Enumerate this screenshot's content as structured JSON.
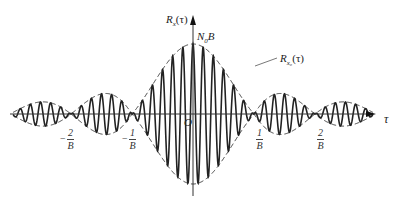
{
  "figure": {
    "y_axis_label": "R",
    "y_axis_label_sub": "x",
    "y_axis_label_arg": "(τ)",
    "peak_label": "N",
    "peak_label_sub": "0",
    "peak_label_tail": "B",
    "envelope_label": "R",
    "envelope_label_sub": "x₀",
    "envelope_label_arg": "(τ)",
    "x_axis_label": "τ",
    "origin_label": "O",
    "ticks": [
      {
        "sign": "−",
        "num": "2",
        "den": "B"
      },
      {
        "sign": "−",
        "num": "1",
        "den": "B"
      },
      {
        "sign": "",
        "num": "1",
        "den": "B"
      },
      {
        "sign": "",
        "num": "2",
        "den": "B"
      }
    ]
  },
  "chart_data": {
    "type": "line",
    "title": "",
    "xlabel": "τ",
    "ylabel": "R_x(τ)",
    "series": [
      {
        "name": "R_x(τ) = N0·B·sinc(Bτ)·cos(ω0·τ)",
        "style": "solid",
        "description": "bandpass noise autocorrelation, oscillating carrier under sinc envelope"
      },
      {
        "name": "R_x0(τ) envelope",
        "style": "dashed",
        "description": "±N0·B·sinc(Bτ) envelope"
      }
    ],
    "x_ticks": [
      "-2/B",
      "-1/B",
      "O",
      "1/B",
      "2/B"
    ],
    "x_range_in_units_of_1_over_B": [
      -3,
      3
    ],
    "peak_value": "N0B",
    "envelope_zeros": [
      "-2/B",
      "-1/B",
      "1/B",
      "2/B"
    ],
    "carrier_cycles_per_1_over_B": 6,
    "grid": false,
    "legend": "none (inline labels)"
  }
}
